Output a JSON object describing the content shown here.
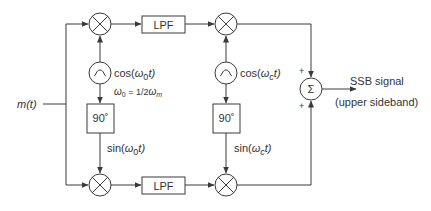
{
  "diagram": {
    "input_label": "m(t)",
    "top_path": {
      "mixer1": "multiplier",
      "filter_label": "LPF",
      "mixer2": "multiplier"
    },
    "bottom_path": {
      "mixer1": "multiplier",
      "filter_label": "LPF",
      "mixer2": "multiplier"
    },
    "oscillator1": {
      "cos_label": {
        "prefix": "cos(",
        "omega": "ω",
        "sub": "0",
        "suffix": "t)"
      },
      "sin_label": {
        "prefix": "sin(",
        "omega": "ω",
        "sub": "0",
        "suffix": "t)"
      },
      "freq_relation": {
        "lhs_omega": "ω",
        "lhs_sub": "0",
        "eq": " = 1/2",
        "rhs_omega": "ω",
        "rhs_sub": "m"
      },
      "phase_shift_label": "90˚"
    },
    "oscillator2": {
      "cos_label": {
        "prefix": "cos(",
        "omega": "ω",
        "sub": "c",
        "suffix": "t)"
      },
      "sin_label": {
        "prefix": "sin(",
        "omega": "ω",
        "sub": "c",
        "suffix": "t)"
      },
      "phase_shift_label": "90˚"
    },
    "summer": {
      "symbol": "Σ",
      "top_sign": "+",
      "bottom_sign": "+"
    },
    "output": {
      "label_line1": "SSB signal",
      "label_line2": "(upper sideband)"
    },
    "colors": {
      "line": "#3a3a3a",
      "text": "#333333",
      "background": "#ffffff"
    }
  }
}
